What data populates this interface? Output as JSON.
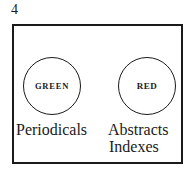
{
  "page_number": "4",
  "diagram": {
    "circles": [
      {
        "label": "GREEN",
        "caption_lines": [
          "Periodicals"
        ]
      },
      {
        "label": "RED",
        "caption_lines": [
          "Abstracts",
          "Indexes"
        ]
      }
    ]
  }
}
